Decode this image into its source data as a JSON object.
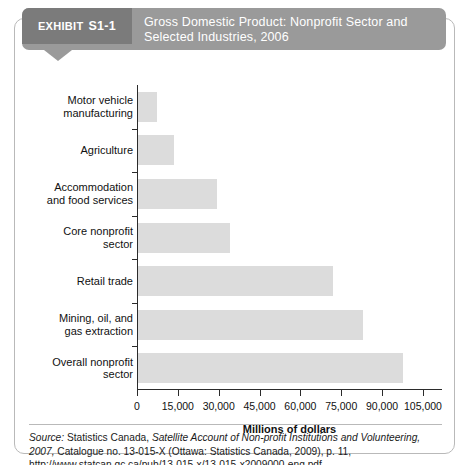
{
  "exhibit": {
    "tag_word": "EXHIBIT",
    "tag_number": "S1-1",
    "title": "Gross Domestic Product: Nonprofit Sector and Selected Industries, 2006"
  },
  "source": {
    "label": "Source:",
    "line": "Statistics Canada, Satellite Account of Non-profit Institutions and Volunteering, 2007, Catalogue no. 13-015-X (Ottawa: Statistics Canada, 2009), p. 11, http://www.statcan.gc.ca/pub/13-015-x/13-015-x2009000-eng.pdf.",
    "italic_title": "Satellite Account of Non-profit Institutions and Volunteering, 2007,"
  },
  "chart_data": {
    "type": "bar",
    "orientation": "horizontal",
    "title": "Gross Domestic Product: Nonprofit Sector and Selected Industries, 2006",
    "xlabel": "Millions of dollars",
    "ylabel": "",
    "xlim": [
      0,
      112000
    ],
    "grid": false,
    "legend": false,
    "bar_color": "#dcdcdc",
    "tick_values": [
      0,
      15000,
      30000,
      45000,
      60000,
      75000,
      90000,
      105000
    ],
    "tick_labels": [
      "0",
      "15,000",
      "30,000",
      "45,000",
      "60,000",
      "75,000",
      "90,000",
      "105,000"
    ],
    "categories": [
      "Motor vehicle manufacturing",
      "Agriculture",
      "Accommodation and food services",
      "Core nonprofit sector",
      "Retail trade",
      "Mining, oil, and gas extraction",
      "Overall nonprofit sector"
    ],
    "category_lines": [
      [
        "Motor vehicle",
        "manufacturing"
      ],
      [
        "Agriculture"
      ],
      [
        "Accommodation",
        "and food services"
      ],
      [
        "Core nonprofit",
        "sector"
      ],
      [
        "Retail trade"
      ],
      [
        "Mining, oil, and",
        "gas extraction"
      ],
      [
        "Overall nonprofit",
        "sector"
      ]
    ],
    "values": [
      6800,
      13300,
      28900,
      33800,
      71700,
      82800,
      97200
    ]
  }
}
